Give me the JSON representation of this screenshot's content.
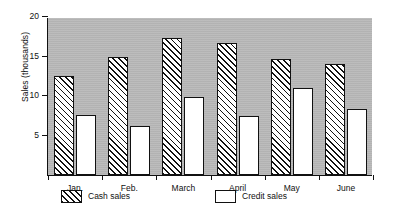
{
  "chart_data": {
    "type": "bar",
    "title": "",
    "xlabel": "",
    "ylabel": "Sales (thousands)",
    "ylim": [
      0,
      20
    ],
    "yticks": [
      5,
      10,
      15,
      20
    ],
    "ytick_labels": [
      "5",
      "10",
      "15",
      "20"
    ],
    "grid": false,
    "legend_position": "bottom",
    "categories": [
      "Jan.",
      "Feb.",
      "March",
      "April",
      "May",
      "June"
    ],
    "series": [
      {
        "name": "Cash sales",
        "fill": "hatched",
        "values": [
          12.5,
          15.0,
          17.3,
          16.7,
          14.7,
          14.0
        ]
      },
      {
        "name": "Credit sales",
        "fill": "white",
        "values": [
          7.6,
          6.2,
          9.9,
          7.5,
          11.0,
          8.4
        ]
      }
    ]
  },
  "style": {
    "plot_background": "#b9b9b9",
    "axis_color": "#111111",
    "bar_edge": "#111111",
    "bar_face": "#ffffff",
    "page_background": "#ffffff"
  }
}
